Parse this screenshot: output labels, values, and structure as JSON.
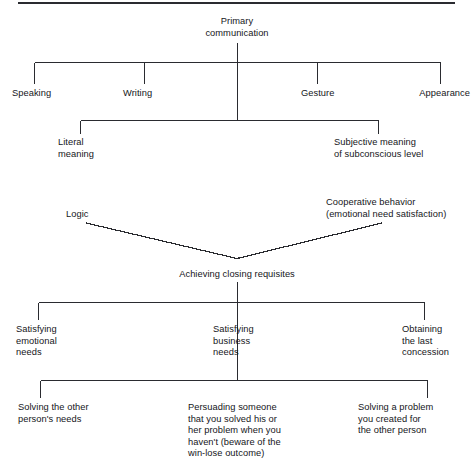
{
  "diagram": {
    "title_divider": "horizontal-rule",
    "root": {
      "label": "Primary\ncommunication"
    },
    "level1": [
      {
        "label": "Speaking"
      },
      {
        "label": "Writing"
      },
      {
        "label": "Gesture"
      },
      {
        "label": "Appearance"
      }
    ],
    "level2": [
      {
        "label": "Literal\nmeaning"
      },
      {
        "label": "Subjective meaning\nof subconscious level"
      }
    ],
    "level3": [
      {
        "label": "Logic"
      },
      {
        "label": "Cooperative behavior\n(emotional need satisfaction)"
      }
    ],
    "hub": {
      "label": "Achieving closing requisites"
    },
    "level4": [
      {
        "label": "Satisfying\nemotional\nneeds"
      },
      {
        "label": "Satisfying\nbusiness\nneeds"
      },
      {
        "label": "Obtaining\nthe last\nconcession"
      }
    ],
    "level5": [
      {
        "label": "Solving the other\nperson's needs"
      },
      {
        "label": "Persuading someone\nthat you solved his or\nher problem when you\nhaven't (beware of the\nwin-lose outcome)"
      },
      {
        "label": "Solving a problem\nyou created for\nthe other person"
      }
    ],
    "colors": {
      "line": "#2a2b30",
      "text": "#15161a",
      "background": "#ffffff"
    }
  }
}
